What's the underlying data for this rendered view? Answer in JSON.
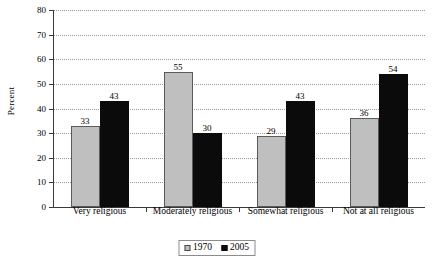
{
  "chart_data": {
    "type": "bar",
    "title": "",
    "xlabel": "",
    "ylabel": "Percent",
    "ylim": [
      0,
      80
    ],
    "yticks": [
      0,
      10,
      20,
      30,
      40,
      50,
      60,
      70,
      80
    ],
    "ytick_labels": [
      "0",
      "10",
      "20",
      "30",
      "40",
      "50",
      "60",
      "70",
      "80"
    ],
    "grid": "horizontal-dotted",
    "legend_position": "bottom-center",
    "categories": [
      "Very religious",
      "Moderately religious",
      "Somewhat religious",
      "Not at all religious"
    ],
    "series": [
      {
        "name": "1970",
        "color": "#bfbfbf",
        "values": [
          33,
          55,
          29,
          36
        ],
        "value_labels": [
          "33",
          "55",
          "29",
          "36"
        ]
      },
      {
        "name": "2005",
        "color": "#0b0b0b",
        "values": [
          43,
          30,
          43,
          54
        ],
        "value_labels": [
          "43",
          "30",
          "43",
          "54"
        ]
      }
    ]
  },
  "legend": {
    "entries": [
      {
        "label": "1970",
        "swatch": "light-gray-square-swatch"
      },
      {
        "label": "2005",
        "swatch": "black-square-swatch"
      }
    ]
  }
}
